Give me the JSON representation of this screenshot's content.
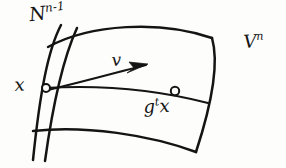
{
  "figure": {
    "kind": "hand-drawn-mathematical-diagram",
    "background_color": "#fdfdfb",
    "ink_color": "#141414",
    "width": 286,
    "height": 168
  },
  "labels": {
    "manifold_surface": {
      "base": "V",
      "superscript": "n"
    },
    "transversal_section": {
      "base": "N",
      "superscript": "n-1"
    },
    "base_point": {
      "base": "x"
    },
    "flow_image_point": {
      "base_g": "g",
      "superscript_t": "t",
      "base_x": "x"
    },
    "tangent_vector": {
      "base": "v"
    }
  },
  "geometry": {
    "patch_top_edge": "M 48 47 C 90 24, 160 20, 212 38",
    "patch_bottom_edge": "M 33 131 C 85 125, 150 135, 196 152",
    "patch_left_edge": "M 61 25 C 48 50, 40 92, 33 160",
    "patch_right_edge": "M 212 38 C 219 62, 213 100, 196 152",
    "transversal_curve": "M 77 28 C 66 52, 54 96, 45 161",
    "trajectory_curve": "M 45 88 C 95 85, 150 88, 208 103",
    "tangent_arrow_shaft": "M 48 90 C 90 80, 118 72, 146 65",
    "arrow_head_points": "148,64 129,62 134,68 127,73",
    "point_x_marker": {
      "cx": 46,
      "cy": 88,
      "r": 4.0
    },
    "point_gtx_marker": {
      "cx": 175,
      "cy": 91,
      "r": 4.2
    }
  }
}
